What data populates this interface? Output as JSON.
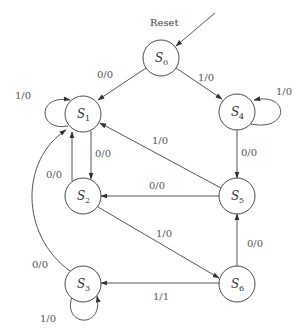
{
  "diagram": {
    "type": "finite-state-machine",
    "reset_label": "Reset",
    "colors": {
      "stroke": "#555555",
      "text": "#555555",
      "fill": "#ffffff"
    },
    "states": [
      {
        "id": "S0",
        "letter": "S",
        "sub": "0",
        "x": 161,
        "y": 58
      },
      {
        "id": "S1",
        "letter": "S",
        "sub": "1",
        "x": 83,
        "y": 114
      },
      {
        "id": "S4",
        "letter": "S",
        "sub": "4",
        "x": 237,
        "y": 112
      },
      {
        "id": "S2",
        "letter": "S",
        "sub": "2",
        "x": 83,
        "y": 196
      },
      {
        "id": "S5",
        "letter": "S",
        "sub": "5",
        "x": 237,
        "y": 196
      },
      {
        "id": "S3",
        "letter": "S",
        "sub": "3",
        "x": 83,
        "y": 284
      },
      {
        "id": "S6",
        "letter": "S",
        "sub": "6",
        "x": 237,
        "y": 284
      }
    ],
    "transitions": [
      {
        "from": "S0",
        "to": "S1",
        "label": "0/0"
      },
      {
        "from": "S0",
        "to": "S4",
        "label": "1/0"
      },
      {
        "from": "S1",
        "to": "S1",
        "label": "1/0"
      },
      {
        "from": "S1",
        "to": "S2",
        "label": "0/0"
      },
      {
        "from": "S2",
        "to": "S1",
        "label": "0/0"
      },
      {
        "from": "S2",
        "to": "S6",
        "label": "1/0"
      },
      {
        "from": "S3",
        "to": "S1",
        "label": "0/0"
      },
      {
        "from": "S3",
        "to": "S3",
        "label": "1/0"
      },
      {
        "from": "S4",
        "to": "S4",
        "label": "1/0"
      },
      {
        "from": "S4",
        "to": "S5",
        "label": "0/0"
      },
      {
        "from": "S5",
        "to": "S1",
        "label": "1/0"
      },
      {
        "from": "S5",
        "to": "S2",
        "label": "0/0"
      },
      {
        "from": "S6",
        "to": "S5",
        "label": "0/0"
      },
      {
        "from": "S6",
        "to": "S3",
        "label": "1/1"
      }
    ]
  }
}
